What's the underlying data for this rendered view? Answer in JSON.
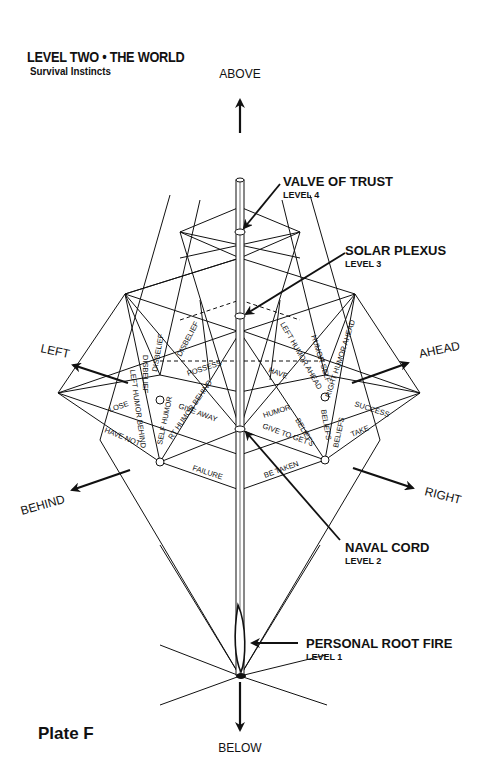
{
  "header": {
    "title": "LEVEL TWO • THE WORLD",
    "subtitle": "Survival Instincts"
  },
  "footer": {
    "plate": "Plate F"
  },
  "directions": {
    "above": "ABOVE",
    "below": "BELOW",
    "left": "LEFT",
    "right": "RIGHT",
    "ahead": "AHEAD",
    "behind": "BEHIND"
  },
  "callouts": [
    {
      "name": "VALVE OF TRUST",
      "level": "LEVEL 4"
    },
    {
      "name": "SOLAR PLEXUS",
      "level": "LEVEL 3"
    },
    {
      "name": "NAVAL CORD",
      "level": "LEVEL 2"
    },
    {
      "name": "PERSONAL ROOT FIRE",
      "level": "LEVEL 1"
    }
  ],
  "plane_labels": {
    "lose": "LOSE",
    "have_not": "HAVE NOT",
    "possess": "POSSESS",
    "give_away": "GIVE AWAY",
    "failure": "FAILURE",
    "have": "HAVE",
    "humor": "HUMOR",
    "give_to_get": "GIVE TO GET",
    "be_taken": "BE TAKEN",
    "success": "SUCCESS",
    "take": "TAKE",
    "disbelief_1": "DISBELIEF",
    "disbelief_2": "DISBELIEF",
    "disbelief_3": "DISBELIEF",
    "left_humor_behind": "LEFT HUMOR BEHIND",
    "self_humor": "SELF HUMOR",
    "rt_humor_behind": "RT HUMOR BEHIND",
    "left_humor_ahead": "LEFT HUMOR AHEAD",
    "humor_self": "HUMOR SELF",
    "right_humor_ahead": "RIGHT HUMOR AHEAD",
    "beliefs_1": "BELIEFS",
    "beliefs_2": "BELIEFS",
    "beliefs_3": "BELIEFS"
  }
}
